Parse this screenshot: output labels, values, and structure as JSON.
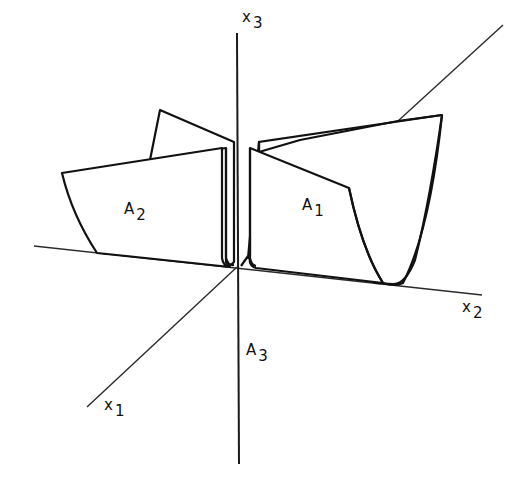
{
  "figure": {
    "type": "3d-coordinate-diagram",
    "stroke_color": "#111111",
    "background": "#ffffff"
  },
  "axes": {
    "x1": {
      "letter": "x",
      "index": "1"
    },
    "x2": {
      "letter": "x",
      "index": "2"
    },
    "x3": {
      "letter": "x",
      "index": "3"
    }
  },
  "regions": {
    "A1": {
      "letter": "A",
      "index": "1"
    },
    "A2": {
      "letter": "A",
      "index": "2"
    },
    "A3": {
      "letter": "A",
      "index": "3"
    }
  }
}
